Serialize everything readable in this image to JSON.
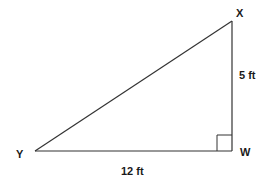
{
  "diagram": {
    "type": "right-triangle",
    "vertices": {
      "X": {
        "label": "X",
        "x": 232,
        "y": 21
      },
      "W": {
        "label": "W",
        "x": 232,
        "y": 151
      },
      "Y": {
        "label": "Y",
        "x": 35,
        "y": 151
      }
    },
    "sides": {
      "XW": {
        "label": "5 ft",
        "length": 5,
        "unit": "ft"
      },
      "YW": {
        "label": "12 ft",
        "length": 12,
        "unit": "ft"
      },
      "XY": {
        "label": "",
        "length": null,
        "unit": "ft"
      }
    },
    "right_angle_at": "W",
    "colors": {
      "stroke": "#333333",
      "text": "#1a1a1a",
      "background": "#ffffff"
    }
  }
}
